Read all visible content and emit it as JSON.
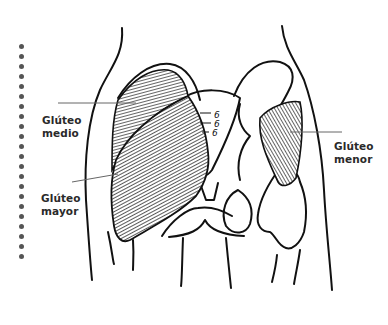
{
  "diagram": {
    "labels": [
      {
        "id": "gluteo-medio",
        "line1": "Glúteo",
        "line2": "medio"
      },
      {
        "id": "gluteo-mayor",
        "line1": "Glúteo",
        "line2": "mayor"
      },
      {
        "id": "gluteo-menor",
        "line1": "Glúteo",
        "line2": "menor"
      }
    ],
    "decoration": {
      "dot_count": 22,
      "dot_color": "#555555"
    },
    "colors": {
      "ink": "#111111",
      "label": "#2a2a2a",
      "leader": "#666666",
      "background": "#ffffff"
    }
  }
}
